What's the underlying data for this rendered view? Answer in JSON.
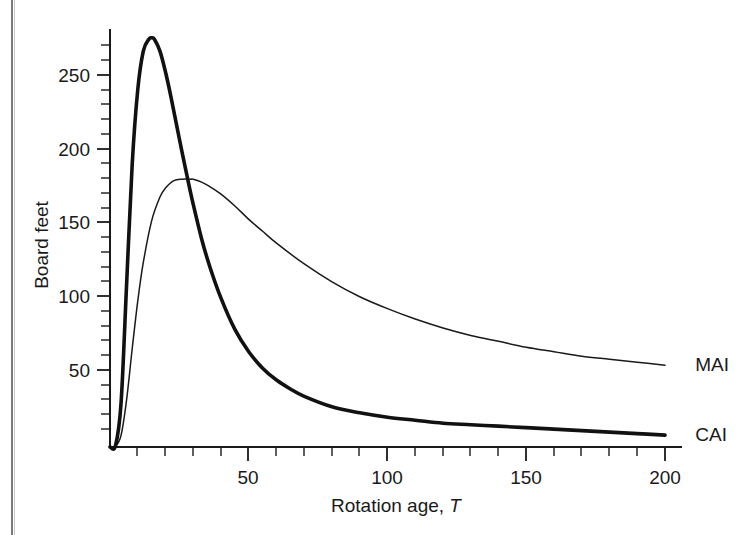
{
  "chart_data": {
    "type": "line",
    "title": "",
    "subtitle": "",
    "xlabel": "Rotation age, T",
    "xlabel_plain": "Rotation age,",
    "xlabel_italic": "T",
    "ylabel": "Board feet",
    "xlim": [
      0,
      205
    ],
    "ylim": [
      0,
      290
    ],
    "x_major_ticks": [
      50,
      100,
      150,
      200
    ],
    "x_major_tick_labels": [
      "50",
      "100",
      "150",
      "200"
    ],
    "x_minor_tick_interval": 10,
    "y_major_ticks": [
      50,
      100,
      150,
      200,
      250
    ],
    "y_major_tick_labels": [
      "50",
      "100",
      "150",
      "200",
      "250"
    ],
    "y_minor_tick_interval": 10,
    "grid": false,
    "legend_position": "right-inline-annotation",
    "annotations": [
      {
        "text": "MAI",
        "x": 203,
        "y": 56
      },
      {
        "text": "CAI",
        "x": 203,
        "y": 9
      }
    ],
    "series": [
      {
        "name": "CAI",
        "label": "CAI",
        "description": "Current annual increment - thick line, sharp early peak",
        "style": "thick",
        "color": "#111111",
        "x": [
          0,
          2,
          4,
          6,
          8,
          10,
          12,
          14,
          15,
          16,
          18,
          20,
          22,
          25,
          28,
          30,
          33,
          36,
          40,
          45,
          50,
          55,
          60,
          65,
          70,
          80,
          90,
          100,
          110,
          120,
          130,
          140,
          150,
          160,
          170,
          180,
          190,
          200
        ],
        "y": [
          0,
          1,
          30,
          110,
          190,
          240,
          266,
          274,
          275,
          274,
          266,
          252,
          235,
          207,
          180,
          163,
          140,
          121,
          100,
          79,
          64,
          53,
          45,
          39,
          34,
          27,
          23,
          20,
          18,
          16,
          15,
          14,
          13,
          12,
          11,
          10,
          9,
          8
        ]
      },
      {
        "name": "MAI",
        "label": "MAI",
        "description": "Mean annual increment - thin line, broad later peak",
        "style": "thin",
        "color": "#1a1a1a",
        "x": [
          0,
          2,
          4,
          6,
          8,
          10,
          12,
          15,
          18,
          20,
          23,
          26,
          29,
          30,
          33,
          36,
          40,
          45,
          50,
          55,
          60,
          70,
          80,
          90,
          100,
          110,
          120,
          130,
          140,
          150,
          160,
          170,
          180,
          190,
          200
        ],
        "y": [
          0,
          0.5,
          8,
          32,
          66,
          98,
          124,
          152,
          168,
          174,
          179,
          180,
          180,
          180,
          178,
          175,
          170,
          162,
          153,
          145,
          137,
          123,
          111,
          101,
          93,
          86,
          80,
          75,
          71,
          67,
          64,
          61,
          59,
          57,
          55
        ]
      }
    ],
    "crossing_point": {
      "x": 30,
      "y": 180,
      "note": "CAI crosses MAI at MAI maximum"
    },
    "peaks": [
      {
        "series": "CAI",
        "x": 15,
        "y": 275
      },
      {
        "series": "MAI",
        "x": 29,
        "y": 180
      }
    ]
  },
  "figure": {
    "background_color": "#ffffff",
    "axis_color": "#1a1a1a",
    "page_edge_color": "#7a7a7a"
  }
}
